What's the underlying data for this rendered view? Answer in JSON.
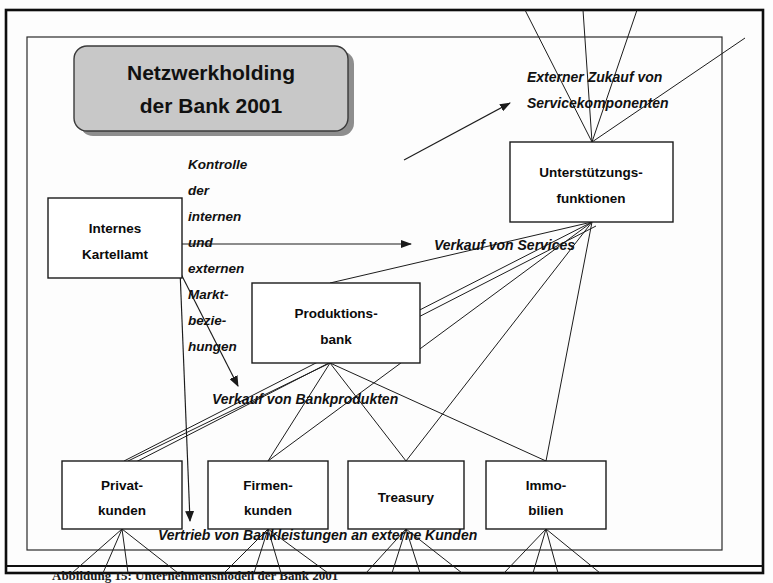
{
  "document": {
    "title": "Netzwerkholding der Bank 2001",
    "caption": "Abbildung 15: Unternehmensmodell der Bank 2001"
  },
  "title_box": {
    "line1": "Netzwerkholding",
    "line2": "der Bank 2001",
    "fill_color": "#c8c8c8",
    "shadow_color": "#8e8e8e"
  },
  "nodes": [
    {
      "id": "internes-kartellamt",
      "line1": "Internes",
      "line2": "Kartellamt",
      "x": 48,
      "y": 198,
      "w": 134,
      "h": 80
    },
    {
      "id": "produktionsbank",
      "line1": "Produktions-",
      "line2": "bank",
      "x": 252,
      "y": 283,
      "w": 168,
      "h": 80
    },
    {
      "id": "unterstuetzungsfunktionen",
      "line1": "Unterstützungs-",
      "line2": "funktionen",
      "x": 510,
      "y": 142,
      "w": 163,
      "h": 80
    },
    {
      "id": "privatkunden",
      "line1": "Privat-",
      "line2": "kunden",
      "x": 62,
      "y": 461,
      "w": 120,
      "h": 68
    },
    {
      "id": "firmenkunden",
      "line1": "Firmen-",
      "line2": "kunden",
      "x": 208,
      "y": 461,
      "w": 120,
      "h": 68
    },
    {
      "id": "treasury",
      "line1": "Treasury",
      "line2": "",
      "x": 348,
      "y": 461,
      "w": 116,
      "h": 68
    },
    {
      "id": "immobilien",
      "line1": "Immo-",
      "line2": "bilien",
      "x": 486,
      "y": 461,
      "w": 120,
      "h": 68
    }
  ],
  "flow_labels": [
    {
      "id": "externer-zukauf",
      "line1": "Externer Zukauf von",
      "line2": "Servicekomponenten",
      "x": 527,
      "y": 82
    },
    {
      "id": "verkauf-von-services",
      "line1": "Verkauf von Services",
      "line2": "",
      "x": 434,
      "y": 250
    },
    {
      "id": "verkauf-von-bankprodukten",
      "line1": "Verkauf von Bankprodukten",
      "line2": "",
      "x": 212,
      "y": 404
    },
    {
      "id": "vertrieb-von-bankleistungen",
      "line1": "Vertrieb von Bankleistungen an externe Kunden",
      "line2": "",
      "x": 158,
      "y": 540
    }
  ],
  "side_label": {
    "id": "kontrolle-der-marktbeziehungen",
    "full_text": "Kontrolle der internen und externen Marktbeziehungen",
    "lines": [
      "Kontrolle",
      "der",
      "internen",
      "und",
      "externen",
      "Markt-",
      "bezie-",
      "hungen"
    ],
    "x": 188,
    "y_start": 169,
    "line_height": 26
  },
  "colors": {
    "ink": "#1a1a1a",
    "page": "#fdfdfd",
    "box_fill": "#ffffff",
    "title_fill": "#c8c8c8"
  }
}
